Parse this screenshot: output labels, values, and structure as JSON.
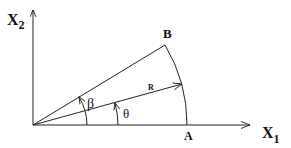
{
  "diagram": {
    "type": "polar-sector",
    "labels": {
      "x_axis": "X",
      "x_axis_sub": "1",
      "y_axis": "X",
      "y_axis_sub": "2",
      "point_a": "A",
      "point_b": "B",
      "radius": "R",
      "angle_beta": "β",
      "angle_theta": "θ"
    },
    "colors": {
      "stroke": "#222222",
      "background": "#ffffff"
    }
  }
}
